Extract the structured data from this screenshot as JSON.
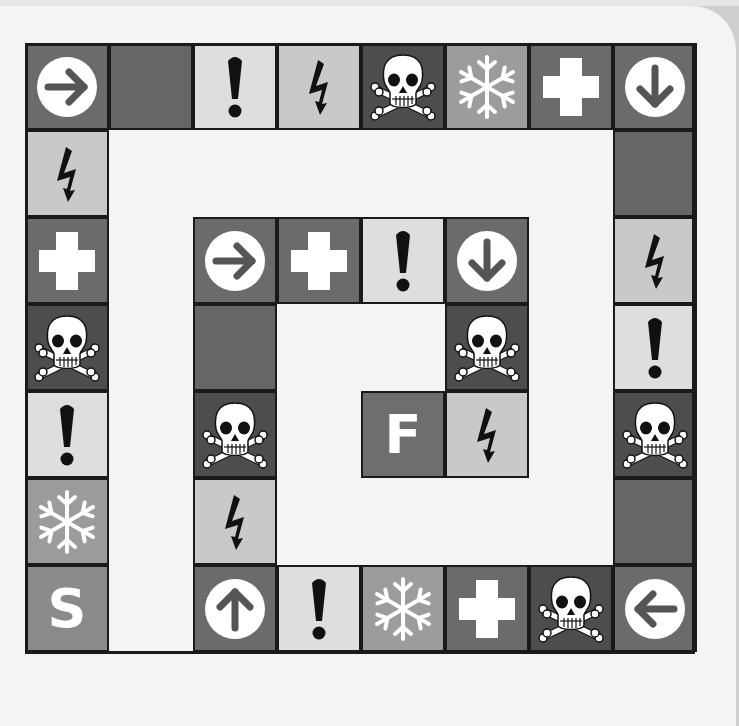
{
  "board": {
    "title": "",
    "columns": 8,
    "rows": 7,
    "origin": {
      "x": 25,
      "y": 43
    },
    "cell_size": {
      "w": 84,
      "h": 87
    },
    "colors": {
      "background": "#f4f4f4",
      "border": "#1a1a1a",
      "dark": "#6b6b6b",
      "skull": "#4d4d4d",
      "exclaim": "#dedede",
      "bolt": "#c9c9c9",
      "snow": "#9c9c9c",
      "start": "#8a8a8a",
      "finish": "#6e6e6e"
    },
    "start_label": "S",
    "finish_label": "F",
    "cells": [
      {
        "col": 0,
        "row": 0,
        "type": "arrow",
        "dir": "right"
      },
      {
        "col": 1,
        "row": 0,
        "type": "blank"
      },
      {
        "col": 2,
        "row": 0,
        "type": "exclaim"
      },
      {
        "col": 3,
        "row": 0,
        "type": "bolt"
      },
      {
        "col": 4,
        "row": 0,
        "type": "skull"
      },
      {
        "col": 5,
        "row": 0,
        "type": "snow"
      },
      {
        "col": 6,
        "row": 0,
        "type": "plus"
      },
      {
        "col": 7,
        "row": 0,
        "type": "arrow",
        "dir": "down"
      },
      {
        "col": 0,
        "row": 1,
        "type": "bolt"
      },
      {
        "col": 0,
        "row": 2,
        "type": "plus"
      },
      {
        "col": 0,
        "row": 3,
        "type": "skull"
      },
      {
        "col": 0,
        "row": 4,
        "type": "exclaim"
      },
      {
        "col": 0,
        "row": 5,
        "type": "snow"
      },
      {
        "col": 0,
        "row": 6,
        "type": "start",
        "label": "S"
      },
      {
        "col": 7,
        "row": 1,
        "type": "blank"
      },
      {
        "col": 7,
        "row": 2,
        "type": "bolt"
      },
      {
        "col": 7,
        "row": 3,
        "type": "exclaim"
      },
      {
        "col": 7,
        "row": 4,
        "type": "skull"
      },
      {
        "col": 7,
        "row": 5,
        "type": "blank"
      },
      {
        "col": 7,
        "row": 6,
        "type": "arrow",
        "dir": "left"
      },
      {
        "col": 2,
        "row": 6,
        "type": "arrow",
        "dir": "up"
      },
      {
        "col": 3,
        "row": 6,
        "type": "exclaim"
      },
      {
        "col": 4,
        "row": 6,
        "type": "snow"
      },
      {
        "col": 5,
        "row": 6,
        "type": "plus"
      },
      {
        "col": 6,
        "row": 6,
        "type": "skull"
      },
      {
        "col": 2,
        "row": 2,
        "type": "arrow",
        "dir": "right"
      },
      {
        "col": 3,
        "row": 2,
        "type": "plus"
      },
      {
        "col": 4,
        "row": 2,
        "type": "exclaim"
      },
      {
        "col": 5,
        "row": 2,
        "type": "arrow",
        "dir": "down"
      },
      {
        "col": 2,
        "row": 3,
        "type": "blank"
      },
      {
        "col": 5,
        "row": 3,
        "type": "skull"
      },
      {
        "col": 2,
        "row": 4,
        "type": "skull"
      },
      {
        "col": 4,
        "row": 4,
        "type": "finish",
        "label": "F"
      },
      {
        "col": 5,
        "row": 4,
        "type": "bolt"
      },
      {
        "col": 2,
        "row": 5,
        "type": "bolt"
      }
    ]
  }
}
